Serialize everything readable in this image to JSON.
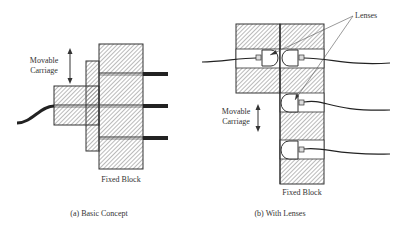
{
  "panels": [
    {
      "id": "a",
      "caption": "(a)  Basic Concept",
      "labels": {
        "carriage_line1": "Movable",
        "carriage_line2": "Carriage",
        "fixed": "Fixed Block"
      }
    },
    {
      "id": "b",
      "caption": "(b)  With Lenses",
      "labels": {
        "lenses": "Lenses",
        "carriage_line1": "Movable",
        "carriage_line2": "Carriage",
        "fixed": "Fixed Block"
      }
    }
  ],
  "colors": {
    "outline": "#333333",
    "hatch": "#555555",
    "fiber": "#222222",
    "background": "#ffffff"
  }
}
